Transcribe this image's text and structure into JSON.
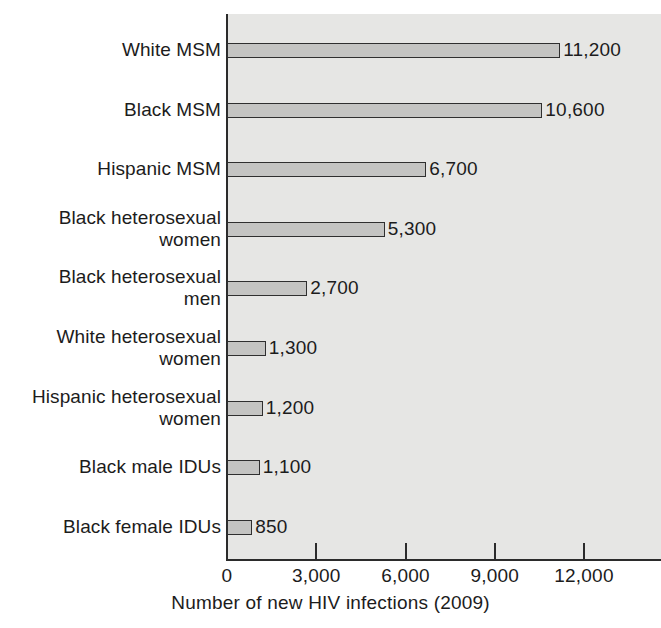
{
  "chart_data": {
    "type": "bar",
    "orientation": "horizontal",
    "title": "",
    "xlabel": "Number of new HIV infections (2009)",
    "ylabel": "",
    "xlim": [
      0,
      14600
    ],
    "xticks": [
      0,
      3000,
      6000,
      9000,
      12000
    ],
    "xtick_labels": [
      "0",
      "3,000",
      "6,000",
      "9,000",
      "12,000"
    ],
    "grid": false,
    "legend": null,
    "categories": [
      "White MSM",
      "Black MSM",
      "Hispanic MSM",
      "Black heterosexual\nwomen",
      "Black heterosexual\nmen",
      "White heterosexual\nwomen",
      "Hispanic heterosexual\nwomen",
      "Black male IDUs",
      "Black female IDUs"
    ],
    "values": [
      11200,
      10600,
      6700,
      5300,
      2700,
      1300,
      1200,
      1100,
      850
    ],
    "value_labels": [
      "11,200",
      "10,600",
      "6,700",
      "5,300",
      "2,700",
      "1,300",
      "1,200",
      "1,100",
      "850"
    ],
    "colors": {
      "bar_fill": "#c4c4c2",
      "bar_edge": "#2f2f2f",
      "plot_background": "#e6e6e4",
      "figure_background": "#ffffff",
      "axis": "#2b2b2b",
      "text": "#1c1c1c"
    }
  }
}
